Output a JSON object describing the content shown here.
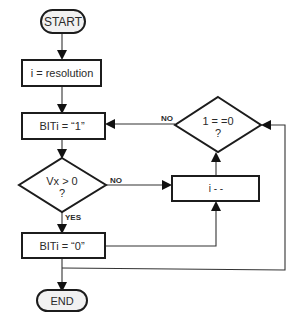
{
  "diagram": {
    "type": "flowchart",
    "nodes": {
      "start": {
        "kind": "terminator",
        "label": "START"
      },
      "init": {
        "kind": "process",
        "label": "i = resolution"
      },
      "set_one": {
        "kind": "process",
        "label": "BITi = “1”"
      },
      "test_vx": {
        "kind": "decision",
        "label_line1": "Vx > 0",
        "label_line2": "?"
      },
      "set_zero": {
        "kind": "process",
        "label": "BITi = “0”"
      },
      "decrement": {
        "kind": "process",
        "label": "i - -"
      },
      "test_i": {
        "kind": "decision",
        "label_line1": "1 = =0",
        "label_line2": "?"
      },
      "end": {
        "kind": "terminator",
        "label": "END"
      }
    },
    "edge_labels": {
      "vx_no": "NO",
      "vx_yes": "YES",
      "i_no": "NO"
    },
    "edges": [
      {
        "from": "start",
        "to": "init"
      },
      {
        "from": "init",
        "to": "set_one"
      },
      {
        "from": "set_one",
        "to": "test_vx"
      },
      {
        "from": "test_vx",
        "to": "set_zero",
        "label": "YES"
      },
      {
        "from": "test_vx",
        "to": "decrement",
        "label": "NO"
      },
      {
        "from": "set_zero",
        "to": "decrement"
      },
      {
        "from": "decrement",
        "to": "test_i"
      },
      {
        "from": "test_i",
        "to": "set_one",
        "label": "NO"
      },
      {
        "from": "set_zero",
        "to": "end"
      },
      {
        "from": "end_junction",
        "to": "test_i"
      }
    ]
  }
}
